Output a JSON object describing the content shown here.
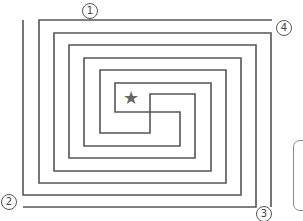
{
  "maze": {
    "stroke_color": "#555555",
    "stroke_width": 1.6,
    "paths": [
      {
        "id": "wall-1",
        "points": [
          [
            23,
            20
          ],
          [
            23,
            195
          ],
          [
            241,
            195
          ],
          [
            241,
            58
          ],
          [
            84,
            58
          ],
          [
            84,
            146
          ],
          [
            180,
            146
          ],
          [
            180,
            112
          ],
          [
            115,
            112
          ],
          [
            115,
            83
          ],
          [
            211,
            83
          ],
          [
            211,
            171
          ],
          [
            54,
            171
          ],
          [
            54,
            33
          ],
          [
            271,
            33
          ],
          [
            271,
            207
          ]
        ]
      },
      {
        "id": "wall-2",
        "points": [
          [
            272,
            20
          ],
          [
            39,
            20
          ],
          [
            39,
            183
          ],
          [
            226,
            183
          ],
          [
            226,
            70
          ],
          [
            100,
            70
          ],
          [
            100,
            133
          ],
          [
            150,
            133
          ],
          [
            150,
            94
          ],
          [
            195,
            94
          ],
          [
            195,
            158
          ],
          [
            69,
            158
          ],
          [
            69,
            45
          ],
          [
            256,
            45
          ],
          [
            256,
            207
          ],
          [
            23,
            207
          ]
        ]
      }
    ],
    "goal": {
      "symbol": "★",
      "color": "#666666",
      "x": 131,
      "y": 98
    }
  },
  "entrances": [
    {
      "label": "1",
      "x": 82,
      "y": 3
    },
    {
      "label": "4",
      "x": 276,
      "y": 20
    },
    {
      "label": "2",
      "x": 1,
      "y": 194
    },
    {
      "label": "3",
      "x": 256,
      "y": 206
    }
  ]
}
